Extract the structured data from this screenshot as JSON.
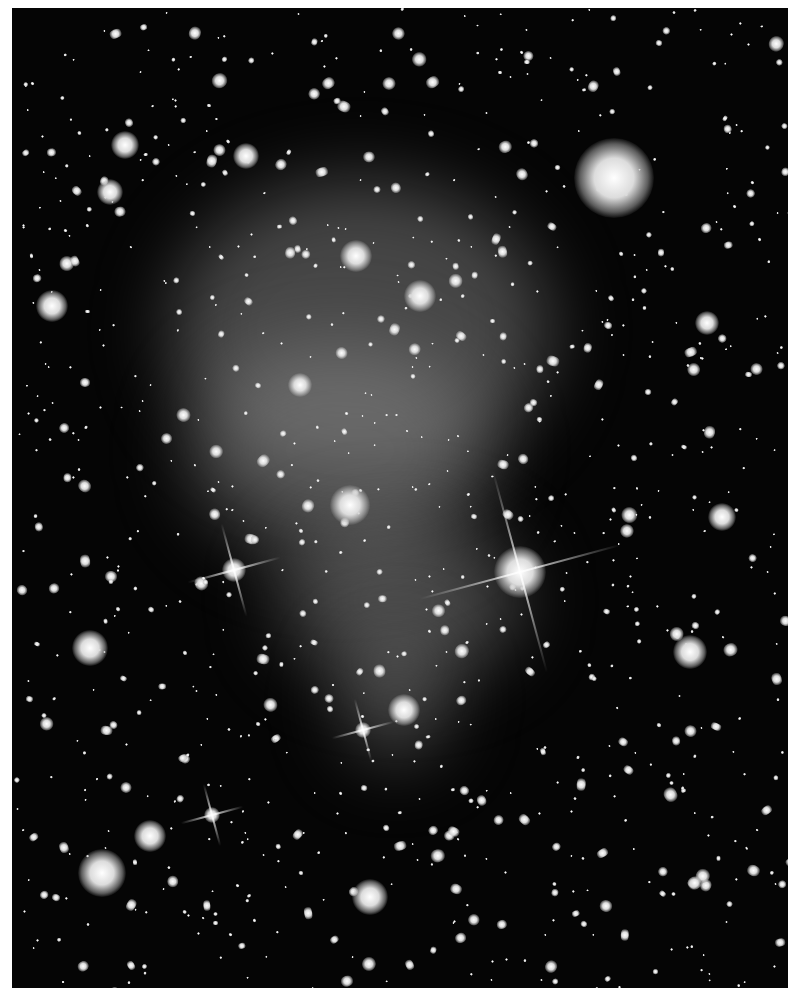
{
  "image": {
    "description": "Deep-field telescope image of a galaxy cluster with diffuse intracluster light",
    "background_color": "#050505",
    "border_color": "#ffffff"
  },
  "features": {
    "diffuse_glow": [
      {
        "x": 360,
        "y": 330,
        "rx": 190,
        "ry": 150
      },
      {
        "x": 340,
        "y": 450,
        "rx": 150,
        "ry": 110
      },
      {
        "x": 400,
        "y": 600,
        "rx": 120,
        "ry": 80
      },
      {
        "x": 395,
        "y": 700,
        "rx": 50,
        "ry": 60
      }
    ],
    "bright_stars": [
      {
        "x": 520,
        "y": 572,
        "r": 26,
        "spikes": true
      },
      {
        "x": 234,
        "y": 570,
        "r": 12,
        "spikes": true
      },
      {
        "x": 363,
        "y": 730,
        "r": 8,
        "spikes": true
      },
      {
        "x": 212,
        "y": 815,
        "r": 8,
        "spikes": true
      }
    ],
    "large_galaxies": [
      {
        "x": 614,
        "y": 178,
        "r": 40
      },
      {
        "x": 102,
        "y": 873,
        "r": 24
      },
      {
        "x": 370,
        "y": 897,
        "r": 18
      },
      {
        "x": 690,
        "y": 652,
        "r": 17
      },
      {
        "x": 90,
        "y": 648,
        "r": 18
      },
      {
        "x": 150,
        "y": 836,
        "r": 16
      },
      {
        "x": 350,
        "y": 505,
        "r": 20
      },
      {
        "x": 356,
        "y": 256,
        "r": 16
      },
      {
        "x": 420,
        "y": 296,
        "r": 16
      },
      {
        "x": 246,
        "y": 156,
        "r": 13
      },
      {
        "x": 110,
        "y": 192,
        "r": 13
      },
      {
        "x": 125,
        "y": 145,
        "r": 14
      },
      {
        "x": 52,
        "y": 306,
        "r": 16
      },
      {
        "x": 722,
        "y": 517,
        "r": 14
      },
      {
        "x": 707,
        "y": 323,
        "r": 12
      },
      {
        "x": 404,
        "y": 710,
        "r": 16
      },
      {
        "x": 300,
        "y": 385,
        "r": 12
      }
    ]
  }
}
